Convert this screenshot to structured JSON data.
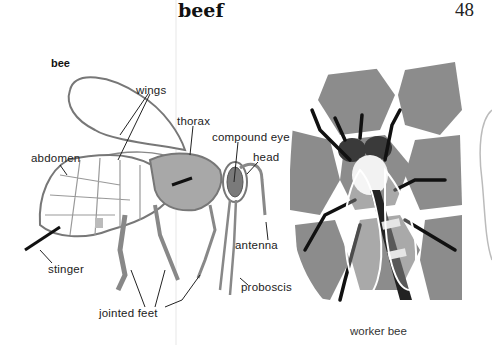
{
  "page": {
    "headword": "beef",
    "page_number": "48",
    "entry_word": "bee"
  },
  "diagram": {
    "labels": {
      "wings": "wings",
      "thorax": "thorax",
      "compound_eye": "compound eye",
      "head": "head",
      "abdomen": "abdomen",
      "antenna": "antenna",
      "stinger": "stinger",
      "proboscis": "proboscis",
      "jointed_feet": "jointed feet"
    }
  },
  "illustration": {
    "caption": "worker bee"
  },
  "colors": {
    "honeycomb": "#8c8c8c",
    "thorax_fill": "#a8a8a8",
    "outline": "#6e6e6e"
  }
}
